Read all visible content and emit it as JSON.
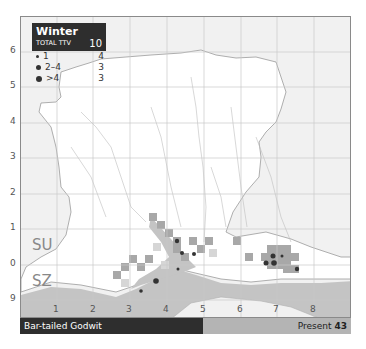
{
  "legend": {
    "season": "Winter",
    "total_label": "TOTAL TTV",
    "total_value": "10",
    "rows": [
      {
        "label": "1",
        "value": "4",
        "dot_size": 3
      },
      {
        "label": "2–4",
        "value": "3",
        "dot_size": 5
      },
      {
        "label": ">4",
        "value": "3",
        "dot_size": 7
      }
    ]
  },
  "map": {
    "grid_refs": [
      "SU",
      "SZ"
    ],
    "x_ticks": [
      "1",
      "2",
      "3",
      "4",
      "5",
      "6",
      "7",
      "8"
    ],
    "y_ticks": [
      "6",
      "5",
      "4",
      "3",
      "2",
      "1",
      "0",
      "9"
    ],
    "colors": {
      "land": "#ffffff",
      "outside": "#f1f1f1",
      "sea": "#c4c4c4",
      "occupied_tetrad": "#a8a8a8",
      "light_tetrad": "#d6d6d6",
      "dot": "#333333"
    }
  },
  "footer": {
    "species": "Bar-tailed Godwit",
    "present_label": "Present",
    "present_value": "43"
  }
}
